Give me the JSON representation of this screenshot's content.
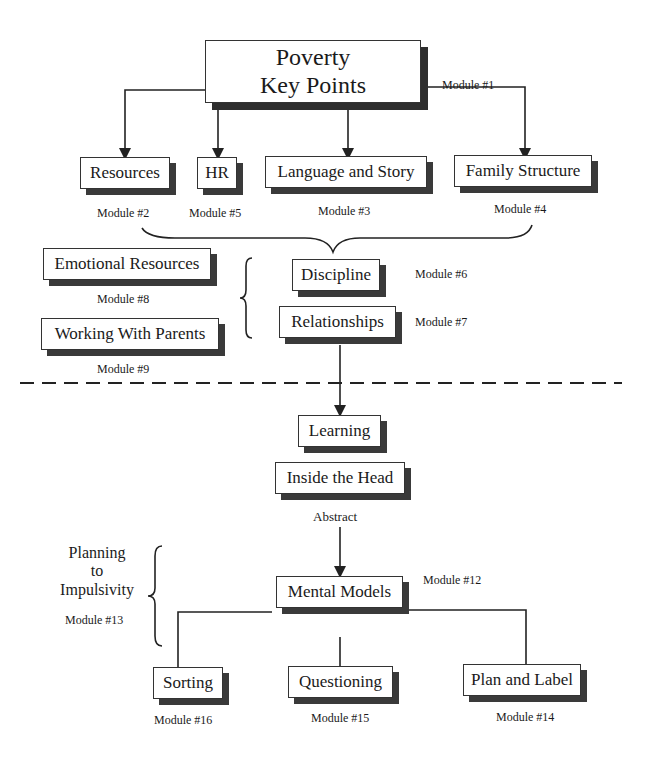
{
  "diagram": {
    "title": {
      "line1": "Poverty",
      "line2": "Key Points",
      "module": "Module #1"
    },
    "level1": [
      {
        "label": "Resources",
        "module": "Module #2"
      },
      {
        "label": "HR",
        "module": "Module #5"
      },
      {
        "label": "Language and Story",
        "module": "Module #3"
      },
      {
        "label": "Family Structure",
        "module": "Module #4"
      }
    ],
    "side_boxes": [
      {
        "label": "Emotional Resources",
        "module": "Module #8"
      },
      {
        "label": "Working With Parents",
        "module": "Module #9"
      }
    ],
    "middle": [
      {
        "label": "Discipline",
        "module": "Module #6"
      },
      {
        "label": "Relationships",
        "module": "Module #7"
      }
    ],
    "lower": {
      "learning": "Learning",
      "inside_head": "Inside the Head",
      "abstract": "Abstract",
      "mental_models": "Mental Models",
      "mental_models_module": "Module #12",
      "planning": {
        "line1": "Planning",
        "line2": "to",
        "line3": "Impulsivity",
        "module": "Module #13"
      }
    },
    "bottom": [
      {
        "label": "Sorting",
        "module": "Module #16"
      },
      {
        "label": "Questioning",
        "module": "Module #15"
      },
      {
        "label": "Plan and Label",
        "module": "Module #14"
      }
    ]
  }
}
